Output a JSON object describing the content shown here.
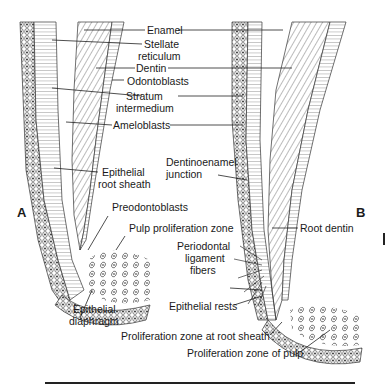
{
  "figure": {
    "panels": [
      "A",
      "B"
    ],
    "labels": {
      "enamel": "Enamel",
      "stellate_1": "Stellate",
      "stellate_2": "reticulum",
      "dentin": "Dentin",
      "odontoblasts": "Odontoblasts",
      "stratum_1": "Stratum",
      "stratum_2": "intermedium",
      "ameloblasts": "Ameloblasts",
      "epithelial_root_1": "Epithelial",
      "epithelial_root_2": "root sheath",
      "dej_1": "Dentinoenamel",
      "dej_2": "junction",
      "preodontoblasts": "Preodontoblasts",
      "pulp_prolif": "Pulp proliferation zone",
      "root_dentin": "Root dentin",
      "pdl_1": "Periodontal",
      "pdl_2": "ligament",
      "pdl_3": "fibers",
      "epithelial_rests": "Epithelial rests",
      "diaphragm_1": "Epithelial",
      "diaphragm_2": "diaphragm",
      "prolif_root_sheath": "Proliferation zone at root sheath",
      "prolif_pulp": "Proliferation zone of pulp"
    }
  }
}
